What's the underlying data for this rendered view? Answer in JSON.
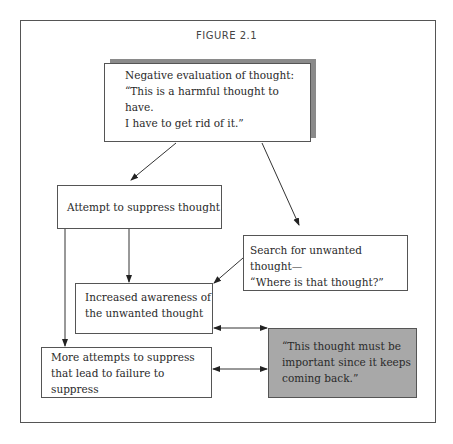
{
  "figure": {
    "title": "FIGURE 2.1",
    "boxes": {
      "negative_evaluation": {
        "lines": [
          "Negative evaluation of thought:",
          "“This is a harmful thought to have.",
          "I have to get rid of it.”"
        ]
      },
      "attempt_suppress": {
        "lines": [
          "Attempt to suppress thought"
        ]
      },
      "search_unwanted": {
        "lines": [
          "Search for unwanted thought—",
          "“Where is that thought?”"
        ]
      },
      "increased_awareness": {
        "lines": [
          "Increased awareness of",
          "the unwanted thought"
        ]
      },
      "more_attempts": {
        "lines": [
          "More attempts to suppress",
          "that lead to failure to suppress"
        ]
      },
      "important_thought": {
        "lines": [
          "“This thought must be",
          "important since it keeps",
          "coming back.”"
        ]
      }
    },
    "colors": {
      "border": "#555555",
      "shadow": "#8a8a8a",
      "highlight_box": "#a8a8a8"
    }
  }
}
